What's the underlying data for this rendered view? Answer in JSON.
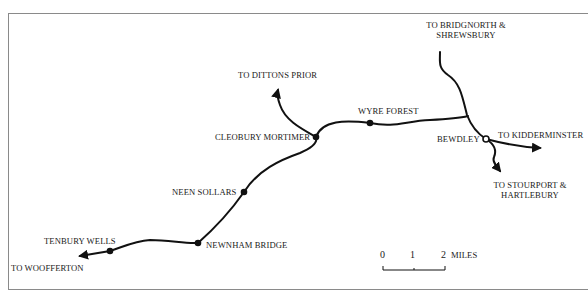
{
  "map": {
    "title": "Tenbury Wells to Bewdley railway line",
    "colors": {
      "line": "#111111",
      "frame": "#8a8a8a",
      "text": "#1a1a1a",
      "background": "#ffffff"
    },
    "stations": [
      {
        "name": "TENBURY WELLS",
        "x": 110,
        "y": 251
      },
      {
        "name": "NEWNHAM BRIDGE",
        "x": 198,
        "y": 243
      },
      {
        "name": "NEEN SOLLARS",
        "x": 244,
        "y": 192
      },
      {
        "name": "CLEOBURY MORTIMER",
        "x": 316,
        "y": 137
      },
      {
        "name": "WYRE FOREST",
        "x": 370,
        "y": 123
      },
      {
        "name": "BEWDLEY",
        "x": 486,
        "y": 139
      }
    ],
    "destinations": {
      "woofferton": "TO WOOFFERTON",
      "dittons_prior": "TO DITTONS PRIOR",
      "bridgnorth_line1": "TO BRIDGNORTH &",
      "bridgnorth_line2": "SHREWSBURY",
      "kidderminster": "TO KIDDERMINSTER",
      "stourport_line1": "TO STOURPORT &",
      "stourport_line2": "HARTLEBURY"
    },
    "scale": {
      "ticks": [
        "0",
        "1",
        "2"
      ],
      "unit": "MILES"
    }
  }
}
